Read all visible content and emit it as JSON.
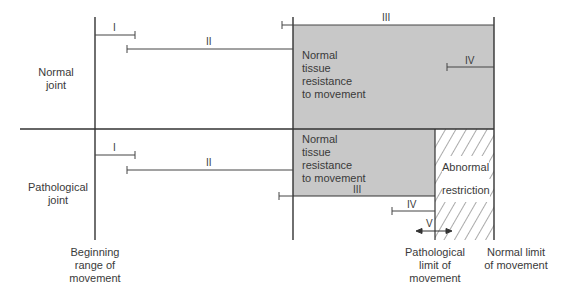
{
  "rows": {
    "normal": {
      "label_line1": "Normal",
      "label_line2": "joint"
    },
    "pathological": {
      "label_line1": "Pathological",
      "label_line2": "joint"
    }
  },
  "regions": {
    "normal_resistance": [
      "Normal",
      "tissue",
      "resistance",
      "to movement"
    ],
    "path_resistance": [
      "Normal",
      "tissue",
      "resistance",
      "to movement"
    ],
    "abnormal": [
      "Abnormal",
      "restriction"
    ]
  },
  "markers": {
    "normal": {
      "I": "I",
      "II": "II",
      "III": "III",
      "IV": "IV"
    },
    "pathological": {
      "I": "I",
      "II": "II",
      "III": "III",
      "IV": "IV",
      "V": "V"
    }
  },
  "axis_labels": {
    "beginning": [
      "Beginning",
      "range of",
      "movement"
    ],
    "pathological_limit": [
      "Pathological",
      "limit of",
      "movement"
    ],
    "normal_limit": [
      "Normal limit",
      "of movement"
    ]
  },
  "colors": {
    "resistance_fill": "#c8c8c8",
    "line": "#333333",
    "hatch": "#555555"
  }
}
